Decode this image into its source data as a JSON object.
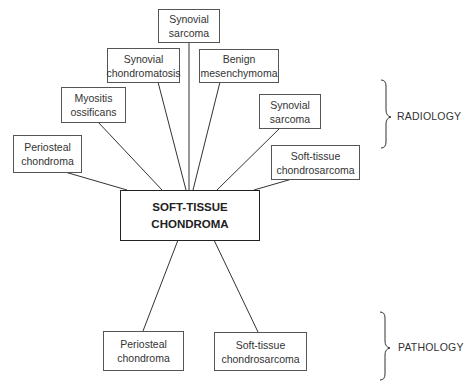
{
  "center": {
    "line1": "SOFT-TISSUE",
    "line2": "CHONDROMA"
  },
  "radiology": {
    "label": "RADIOLOGY",
    "nodes": [
      {
        "line1": "Synovial",
        "line2": "sarcoma"
      },
      {
        "line1": "Synovial",
        "line2": "chondromatosis"
      },
      {
        "line1": "Benign",
        "line2": "mesenchymoma"
      },
      {
        "line1": "Myositis",
        "line2": "ossificans"
      },
      {
        "line1": "Synovial",
        "line2": "sarcoma"
      },
      {
        "line1": "Periosteal",
        "line2": "chondroma"
      },
      {
        "line1": "Soft-tissue",
        "line2": "chondrosarcoma"
      }
    ]
  },
  "pathology": {
    "label": "PATHOLOGY",
    "nodes": [
      {
        "line1": "Periosteal",
        "line2": "chondroma"
      },
      {
        "line1": "Soft-tissue",
        "line2": "chondrosarcoma"
      }
    ]
  }
}
